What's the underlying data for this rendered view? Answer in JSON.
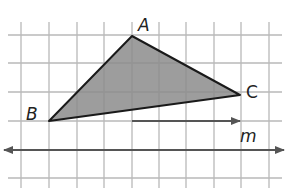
{
  "diagram": {
    "type": "translation-on-grid",
    "grid": {
      "x_lines": [
        21,
        49,
        77,
        104,
        132,
        159,
        186,
        214,
        241,
        269
      ],
      "y_lines": [
        35,
        63,
        92,
        121,
        150,
        178
      ],
      "color": "#b8b8b8"
    },
    "triangle": {
      "vertices": {
        "A": {
          "label": "A",
          "x": 132,
          "y": 36
        },
        "B": {
          "label": "B",
          "x": 49,
          "y": 121
        },
        "C": {
          "label": "C",
          "x": 240,
          "y": 95
        }
      },
      "fill": "#8c8c8c",
      "stroke": "#1a1a1a"
    },
    "vector": {
      "x1": 132,
      "y1": 121,
      "x2": 240,
      "y2": 121,
      "color": "#555555"
    },
    "line_m": {
      "label": "m",
      "y": 150,
      "x1": 4,
      "x2": 284,
      "color": "#555555"
    }
  }
}
